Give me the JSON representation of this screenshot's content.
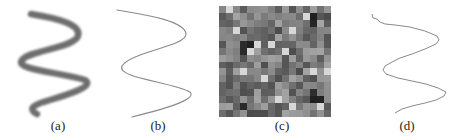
{
  "figure": {
    "panels": [
      {
        "id": "a",
        "label": "(a)",
        "description": "thick blurred gray sinusoidal stroke"
      },
      {
        "id": "b",
        "label": "(b)",
        "description": "thin smooth sinusoidal curve"
      },
      {
        "id": "c",
        "label": "(c)",
        "description": "gray-level noise texture patch"
      },
      {
        "id": "d",
        "label": "(d)",
        "description": "thin jagged reconstructed curve"
      }
    ],
    "colors": {
      "stroke_thick": "#6e6e6e",
      "stroke_thin": "#8a8a8a",
      "noise_base": "#9a9a9a",
      "caption": "#222222"
    }
  }
}
